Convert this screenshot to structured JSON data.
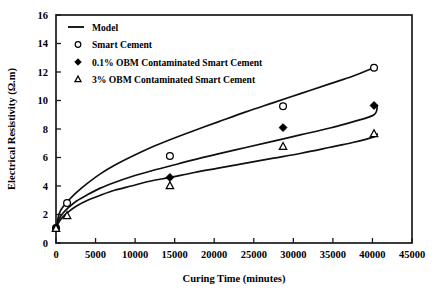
{
  "chart_data": {
    "type": "line",
    "title": "",
    "xlabel": "Curing Time (minutes)",
    "ylabel": "Electrical Resistivity (Ω.m)",
    "xlim": [
      0,
      45000
    ],
    "ylim": [
      0,
      16
    ],
    "xticks": [
      0,
      5000,
      10000,
      15000,
      20000,
      25000,
      30000,
      35000,
      40000,
      45000
    ],
    "xtick_labels": [
      "0",
      "5000",
      "10000",
      "15000",
      "20000",
      "25000",
      "30000",
      "35000",
      "40000",
      "45000"
    ],
    "yticks": [
      0,
      2,
      4,
      6,
      8,
      10,
      12,
      14,
      16
    ],
    "ytick_labels": [
      "0",
      "2",
      "4",
      "6",
      "8",
      "10",
      "12",
      "14",
      "16"
    ],
    "grid": false,
    "legend_position": "upper-left",
    "legend": [
      {
        "key": "model",
        "label": "Model",
        "marker": "line"
      },
      {
        "key": "smart_cement",
        "label": "Smart Cement",
        "marker": "open-circle"
      },
      {
        "key": "obm_01",
        "label": "0.1% OBM Contaminated Smart Cement",
        "marker": "filled-diamond"
      },
      {
        "key": "obm_3",
        "label": "3% OBM Contaminated Smart Cement",
        "marker": "open-triangle"
      }
    ],
    "series": [
      {
        "name": "Smart Cement",
        "marker": "open-circle",
        "x": [
          0,
          1400,
          14400,
          28700,
          40200
        ],
        "values": [
          1.05,
          2.8,
          6.1,
          9.6,
          12.3
        ]
      },
      {
        "name": "0.1% OBM Contaminated Smart Cement",
        "marker": "filled-diamond",
        "x": [
          0,
          14400,
          28700,
          40200
        ],
        "values": [
          1.05,
          4.6,
          8.1,
          9.65
        ]
      },
      {
        "name": "3% OBM Contaminated Smart Cement",
        "marker": "open-triangle",
        "x": [
          0,
          1400,
          14400,
          28700,
          40200
        ],
        "values": [
          1.0,
          1.9,
          4.0,
          6.75,
          7.65
        ]
      }
    ],
    "model_curves": [
      {
        "name": "Model - Smart Cement",
        "points": [
          [
            0,
            1.0
          ],
          [
            400,
            2.05
          ],
          [
            900,
            2.55
          ],
          [
            1600,
            3.0
          ],
          [
            2600,
            3.55
          ],
          [
            4000,
            4.2
          ],
          [
            5600,
            4.85
          ],
          [
            7400,
            5.45
          ],
          [
            9500,
            6.05
          ],
          [
            12000,
            6.7
          ],
          [
            14400,
            7.25
          ],
          [
            17500,
            7.9
          ],
          [
            20500,
            8.5
          ],
          [
            24000,
            9.2
          ],
          [
            27500,
            9.85
          ],
          [
            31000,
            10.5
          ],
          [
            34500,
            11.15
          ],
          [
            37500,
            11.7
          ],
          [
            40200,
            12.3
          ]
        ]
      },
      {
        "name": "Model - 0.1% OBM",
        "points": [
          [
            0,
            1.0
          ],
          [
            400,
            1.7
          ],
          [
            900,
            2.1
          ],
          [
            1600,
            2.5
          ],
          [
            2600,
            2.95
          ],
          [
            4000,
            3.4
          ],
          [
            5600,
            3.85
          ],
          [
            7400,
            4.25
          ],
          [
            9500,
            4.65
          ],
          [
            12000,
            5.05
          ],
          [
            14400,
            5.4
          ],
          [
            17500,
            5.85
          ],
          [
            20500,
            6.25
          ],
          [
            24000,
            6.7
          ],
          [
            27500,
            7.15
          ],
          [
            31000,
            7.6
          ],
          [
            34500,
            8.05
          ],
          [
            37500,
            8.5
          ],
          [
            40200,
            9.0
          ],
          [
            40600,
            9.65
          ]
        ]
      },
      {
        "name": "Model - 3% OBM",
        "points": [
          [
            0,
            1.0
          ],
          [
            400,
            1.5
          ],
          [
            900,
            1.85
          ],
          [
            1600,
            2.2
          ],
          [
            2600,
            2.6
          ],
          [
            4000,
            3.0
          ],
          [
            5600,
            3.35
          ],
          [
            7400,
            3.7
          ],
          [
            9500,
            4.0
          ],
          [
            12000,
            4.35
          ],
          [
            14400,
            4.6
          ],
          [
            17500,
            4.95
          ],
          [
            20500,
            5.25
          ],
          [
            24000,
            5.6
          ],
          [
            27500,
            5.95
          ],
          [
            31000,
            6.3
          ],
          [
            34500,
            6.7
          ],
          [
            37500,
            7.05
          ],
          [
            40200,
            7.45
          ],
          [
            40600,
            7.65
          ]
        ]
      }
    ]
  }
}
